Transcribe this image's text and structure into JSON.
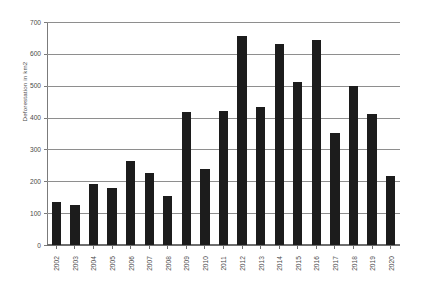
{
  "chart_data": {
    "type": "bar",
    "title": "",
    "xlabel": "",
    "ylabel": "Deforestation in km2",
    "ylim": [
      0,
      700
    ],
    "ytick_step": 100,
    "grid": true,
    "legend": null,
    "bar_color": "#1c1c1c",
    "categories": [
      "2002",
      "2003",
      "2004",
      "2005",
      "2006",
      "2007",
      "2008",
      "2009",
      "2010",
      "2011",
      "2012",
      "2013",
      "2014",
      "2015",
      "2016",
      "2017",
      "2018",
      "2019",
      "2020"
    ],
    "values": [
      135,
      127,
      192,
      178,
      265,
      225,
      153,
      419,
      238,
      421,
      656,
      434,
      632,
      512,
      645,
      352,
      500,
      410,
      218
    ],
    "ytick_labels": [
      "700",
      "600",
      "500",
      "400",
      "300",
      "200",
      "100",
      "0"
    ],
    "ytick_values": [
      700,
      600,
      500,
      400,
      300,
      200,
      100,
      0
    ]
  },
  "axis": {
    "y_title": "Deforestation in km2"
  }
}
